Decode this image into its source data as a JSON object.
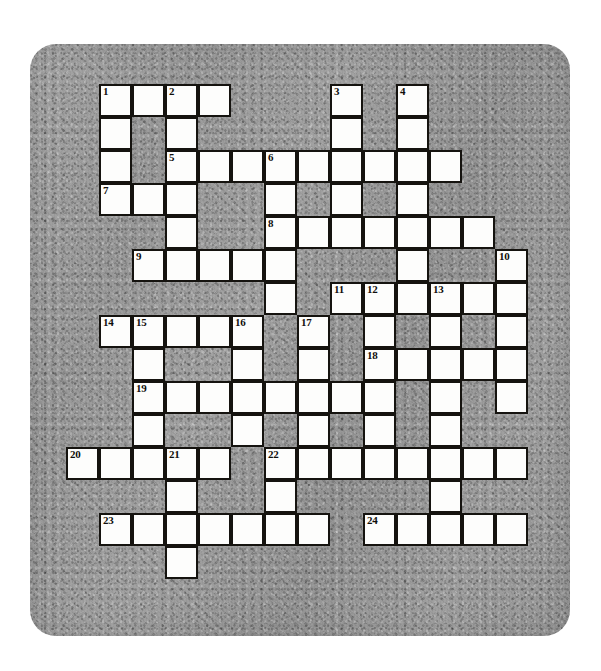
{
  "document": {
    "kind": "crossword-puzzle",
    "title": "",
    "paper": {
      "background_color": "#9d9d9d",
      "page_color": "#ffffff",
      "corner_radius_px": 26
    },
    "grid": {
      "cell_size_px": 33,
      "origin_x_px": 66,
      "origin_y_px": 84,
      "columns": 15,
      "rows": 15,
      "cell_fill_color": "#fdfdfc",
      "cell_border_color": "#15130f",
      "number_color": "#100e0b",
      "total_cells": 177,
      "total_numbered_clues": 24
    },
    "clue_numbers": [
      1,
      2,
      3,
      4,
      5,
      6,
      7,
      8,
      9,
      10,
      11,
      12,
      13,
      14,
      15,
      16,
      17,
      18,
      19,
      20,
      21,
      22,
      23,
      24
    ],
    "entries": [
      {
        "number": 1,
        "direction": "across",
        "row": 0,
        "col": 1,
        "length": 4
      },
      {
        "number": 1,
        "direction": "down",
        "row": 0,
        "col": 1,
        "length": 4
      },
      {
        "number": 2,
        "direction": "down",
        "row": 0,
        "col": 3,
        "length": 5
      },
      {
        "number": 3,
        "direction": "down",
        "row": 0,
        "col": 8,
        "length": 3
      },
      {
        "number": 4,
        "direction": "down",
        "row": 0,
        "col": 10,
        "length": 4
      },
      {
        "number": 5,
        "direction": "across",
        "row": 2,
        "col": 3,
        "length": 9
      },
      {
        "number": 6,
        "direction": "down",
        "row": 2,
        "col": 6,
        "length": 4
      },
      {
        "number": 7,
        "direction": "across",
        "row": 3,
        "col": 1,
        "length": 3
      },
      {
        "number": 8,
        "direction": "across",
        "row": 4,
        "col": 6,
        "length": 7
      },
      {
        "number": 9,
        "direction": "across",
        "row": 5,
        "col": 2,
        "length": 5
      },
      {
        "number": 10,
        "direction": "down",
        "row": 5,
        "col": 13,
        "length": 5
      },
      {
        "number": 11,
        "direction": "across",
        "row": 6,
        "col": 8,
        "length": 6
      },
      {
        "number": 11,
        "direction": "down",
        "row": 6,
        "col": 8,
        "length": 3
      },
      {
        "number": 12,
        "direction": "down",
        "row": 6,
        "col": 9,
        "length": 5
      },
      {
        "number": 13,
        "direction": "down",
        "row": 6,
        "col": 11,
        "length": 5
      },
      {
        "number": 14,
        "direction": "across",
        "row": 7,
        "col": 1,
        "length": 5
      },
      {
        "number": 15,
        "direction": "down",
        "row": 7,
        "col": 2,
        "length": 6
      },
      {
        "number": 16,
        "direction": "down",
        "row": 7,
        "col": 5,
        "length": 4
      },
      {
        "number": 17,
        "direction": "across",
        "row": 7,
        "col": 7,
        "length": 7
      },
      {
        "number": 17,
        "direction": "down",
        "row": 7,
        "col": 7,
        "length": 3
      },
      {
        "number": 18,
        "direction": "across",
        "row": 8,
        "col": 9,
        "length": 5
      },
      {
        "number": 19,
        "direction": "across",
        "row": 9,
        "col": 2,
        "length": 9
      },
      {
        "number": 20,
        "direction": "across",
        "row": 11,
        "col": 0,
        "length": 4
      },
      {
        "number": 21,
        "direction": "across",
        "row": 11,
        "col": 3,
        "length": 2
      },
      {
        "number": 21,
        "direction": "down",
        "row": 11,
        "col": 3,
        "length": 4
      },
      {
        "number": 22,
        "direction": "across",
        "row": 11,
        "col": 6,
        "length": 8
      },
      {
        "number": 22,
        "direction": "down",
        "row": 11,
        "col": 6,
        "length": 3
      },
      {
        "number": 23,
        "direction": "across",
        "row": 13,
        "col": 1,
        "length": 7
      },
      {
        "number": 24,
        "direction": "across",
        "row": 13,
        "col": 9,
        "length": 5
      }
    ],
    "cells": [
      {
        "r": 0,
        "c": 1,
        "n": "1"
      },
      {
        "r": 0,
        "c": 2,
        "n": ""
      },
      {
        "r": 0,
        "c": 3,
        "n": "2"
      },
      {
        "r": 0,
        "c": 4,
        "n": ""
      },
      {
        "r": 0,
        "c": 8,
        "n": "3"
      },
      {
        "r": 0,
        "c": 10,
        "n": "4"
      },
      {
        "r": 1,
        "c": 1,
        "n": ""
      },
      {
        "r": 1,
        "c": 3,
        "n": ""
      },
      {
        "r": 1,
        "c": 8,
        "n": ""
      },
      {
        "r": 1,
        "c": 10,
        "n": ""
      },
      {
        "r": 2,
        "c": 1,
        "n": ""
      },
      {
        "r": 2,
        "c": 3,
        "n": "5"
      },
      {
        "r": 2,
        "c": 4,
        "n": ""
      },
      {
        "r": 2,
        "c": 5,
        "n": ""
      },
      {
        "r": 2,
        "c": 6,
        "n": "6"
      },
      {
        "r": 2,
        "c": 7,
        "n": ""
      },
      {
        "r": 2,
        "c": 8,
        "n": ""
      },
      {
        "r": 2,
        "c": 9,
        "n": ""
      },
      {
        "r": 2,
        "c": 10,
        "n": ""
      },
      {
        "r": 2,
        "c": 11,
        "n": ""
      },
      {
        "r": 3,
        "c": 1,
        "n": "7"
      },
      {
        "r": 3,
        "c": 2,
        "n": ""
      },
      {
        "r": 3,
        "c": 3,
        "n": ""
      },
      {
        "r": 3,
        "c": 6,
        "n": ""
      },
      {
        "r": 3,
        "c": 8,
        "n": ""
      },
      {
        "r": 3,
        "c": 10,
        "n": ""
      },
      {
        "r": 4,
        "c": 3,
        "n": ""
      },
      {
        "r": 4,
        "c": 6,
        "n": "8"
      },
      {
        "r": 4,
        "c": 7,
        "n": ""
      },
      {
        "r": 4,
        "c": 8,
        "n": ""
      },
      {
        "r": 4,
        "c": 9,
        "n": ""
      },
      {
        "r": 4,
        "c": 10,
        "n": ""
      },
      {
        "r": 4,
        "c": 11,
        "n": ""
      },
      {
        "r": 4,
        "c": 12,
        "n": ""
      },
      {
        "r": 5,
        "c": 2,
        "n": "9"
      },
      {
        "r": 5,
        "c": 3,
        "n": ""
      },
      {
        "r": 5,
        "c": 4,
        "n": ""
      },
      {
        "r": 5,
        "c": 5,
        "n": ""
      },
      {
        "r": 5,
        "c": 6,
        "n": ""
      },
      {
        "r": 5,
        "c": 10,
        "n": ""
      },
      {
        "r": 5,
        "c": 13,
        "n": "10"
      },
      {
        "r": 6,
        "c": 6,
        "n": ""
      },
      {
        "r": 6,
        "c": 8,
        "n": "11"
      },
      {
        "r": 6,
        "c": 9,
        "n": "12"
      },
      {
        "r": 6,
        "c": 10,
        "n": ""
      },
      {
        "r": 6,
        "c": 11,
        "n": "13"
      },
      {
        "r": 6,
        "c": 12,
        "n": ""
      },
      {
        "r": 6,
        "c": 13,
        "n": ""
      },
      {
        "r": 7,
        "c": 1,
        "n": "14"
      },
      {
        "r": 7,
        "c": 2,
        "n": "15"
      },
      {
        "r": 7,
        "c": 3,
        "n": ""
      },
      {
        "r": 7,
        "c": 4,
        "n": ""
      },
      {
        "r": 7,
        "c": 5,
        "n": "16"
      },
      {
        "r": 7,
        "c": 7,
        "n": "17"
      },
      {
        "r": 7,
        "c": 9,
        "n": ""
      },
      {
        "r": 7,
        "c": 11,
        "n": ""
      },
      {
        "r": 7,
        "c": 13,
        "n": ""
      },
      {
        "r": 8,
        "c": 2,
        "n": ""
      },
      {
        "r": 8,
        "c": 5,
        "n": ""
      },
      {
        "r": 8,
        "c": 7,
        "n": ""
      },
      {
        "r": 8,
        "c": 9,
        "n": "18"
      },
      {
        "r": 8,
        "c": 10,
        "n": ""
      },
      {
        "r": 8,
        "c": 11,
        "n": ""
      },
      {
        "r": 8,
        "c": 12,
        "n": ""
      },
      {
        "r": 8,
        "c": 13,
        "n": ""
      },
      {
        "r": 9,
        "c": 2,
        "n": "19"
      },
      {
        "r": 9,
        "c": 3,
        "n": ""
      },
      {
        "r": 9,
        "c": 4,
        "n": ""
      },
      {
        "r": 9,
        "c": 5,
        "n": ""
      },
      {
        "r": 9,
        "c": 6,
        "n": ""
      },
      {
        "r": 9,
        "c": 7,
        "n": ""
      },
      {
        "r": 9,
        "c": 8,
        "n": ""
      },
      {
        "r": 9,
        "c": 9,
        "n": ""
      },
      {
        "r": 9,
        "c": 11,
        "n": ""
      },
      {
        "r": 9,
        "c": 13,
        "n": ""
      },
      {
        "r": 10,
        "c": 2,
        "n": ""
      },
      {
        "r": 10,
        "c": 5,
        "n": ""
      },
      {
        "r": 10,
        "c": 7,
        "n": ""
      },
      {
        "r": 10,
        "c": 9,
        "n": ""
      },
      {
        "r": 10,
        "c": 11,
        "n": ""
      },
      {
        "r": 11,
        "c": 0,
        "n": "20"
      },
      {
        "r": 11,
        "c": 1,
        "n": ""
      },
      {
        "r": 11,
        "c": 2,
        "n": ""
      },
      {
        "r": 11,
        "c": 3,
        "n": "21"
      },
      {
        "r": 11,
        "c": 4,
        "n": ""
      },
      {
        "r": 11,
        "c": 6,
        "n": "22"
      },
      {
        "r": 11,
        "c": 7,
        "n": ""
      },
      {
        "r": 11,
        "c": 8,
        "n": ""
      },
      {
        "r": 11,
        "c": 9,
        "n": ""
      },
      {
        "r": 11,
        "c": 10,
        "n": ""
      },
      {
        "r": 11,
        "c": 11,
        "n": ""
      },
      {
        "r": 11,
        "c": 12,
        "n": ""
      },
      {
        "r": 11,
        "c": 13,
        "n": ""
      },
      {
        "r": 12,
        "c": 3,
        "n": ""
      },
      {
        "r": 12,
        "c": 6,
        "n": ""
      },
      {
        "r": 12,
        "c": 11,
        "n": ""
      },
      {
        "r": 13,
        "c": 1,
        "n": "23"
      },
      {
        "r": 13,
        "c": 2,
        "n": ""
      },
      {
        "r": 13,
        "c": 3,
        "n": ""
      },
      {
        "r": 13,
        "c": 4,
        "n": ""
      },
      {
        "r": 13,
        "c": 5,
        "n": ""
      },
      {
        "r": 13,
        "c": 6,
        "n": ""
      },
      {
        "r": 13,
        "c": 7,
        "n": ""
      },
      {
        "r": 13,
        "c": 9,
        "n": "24"
      },
      {
        "r": 13,
        "c": 10,
        "n": ""
      },
      {
        "r": 13,
        "c": 11,
        "n": ""
      },
      {
        "r": 13,
        "c": 12,
        "n": ""
      },
      {
        "r": 13,
        "c": 13,
        "n": ""
      },
      {
        "r": 14,
        "c": 3,
        "n": ""
      }
    ]
  }
}
